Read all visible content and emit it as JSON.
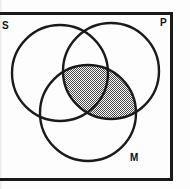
{
  "figure": {
    "type": "venn-diagram",
    "background_color": "#fdfdfd",
    "stroke_color": "#1a1a1a",
    "shade_color": "#8c8c8c",
    "box": {
      "name": "universe-rectangle",
      "x": 0,
      "y": 12,
      "width": 173,
      "height": 169,
      "stroke_width": 3,
      "left_border_cropped": true
    },
    "circles": [
      {
        "id": "S",
        "label": "S",
        "cx": 60,
        "cy": 73,
        "r": 48,
        "stroke_width": 2.4,
        "fill": "none"
      },
      {
        "id": "P",
        "label": "P",
        "cx": 111,
        "cy": 71,
        "r": 48,
        "stroke_width": 2.4,
        "fill": "none"
      },
      {
        "id": "M",
        "label": "M",
        "cx": 88,
        "cy": 113,
        "r": 48,
        "stroke_width": 2.4,
        "fill": "none"
      }
    ],
    "labels": [
      {
        "id": "S",
        "text": "S",
        "x": 2,
        "y": 21,
        "position": "left-edge"
      },
      {
        "id": "P",
        "text": "P",
        "x": 160,
        "y": 18,
        "position": "top-right"
      },
      {
        "id": "M",
        "text": "M",
        "x": 130,
        "y": 153,
        "position": "bottom-right"
      }
    ],
    "shaded_regions": [
      {
        "id": "P-and-M",
        "description": "intersection of circle P and circle M (lens), including the central S-P-M region",
        "pattern": "stipple-checker",
        "pattern_color": "#555555",
        "pattern_spacing_px": 2
      }
    ]
  }
}
